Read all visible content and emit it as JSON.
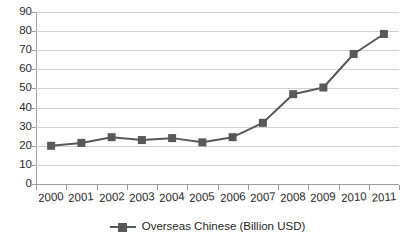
{
  "chart_data": {
    "type": "line",
    "title": "",
    "subtitle": "",
    "xlabel": "",
    "ylabel": "",
    "categories": [
      "2000",
      "2001",
      "2002",
      "2003",
      "2004",
      "2005",
      "2006",
      "2007",
      "2008",
      "2009",
      "2010",
      "2011"
    ],
    "series": [
      {
        "name": "Overseas Chinese (Billion USD)",
        "color": "#595959",
        "marker": "square",
        "values": [
          20,
          21.5,
          24.5,
          23,
          24,
          21.8,
          24.5,
          32,
          47,
          50.5,
          68,
          78.5
        ]
      }
    ],
    "ylim": [
      0,
      90
    ],
    "yticks": [
      0,
      10,
      20,
      30,
      40,
      50,
      60,
      70,
      80,
      90
    ],
    "ytick_labels": [
      "0",
      "10",
      "20",
      "30",
      "40",
      "50",
      "60",
      "70",
      "80",
      "90"
    ],
    "grid": true,
    "grid_axis": "y",
    "legend": {
      "position": "bottom-center",
      "entries": [
        "Overseas Chinese (Billion USD)"
      ]
    }
  },
  "legend": {
    "label": "Overseas Chinese (Billion USD)"
  },
  "colors": {
    "series": "#595959",
    "gridline": "#d2d2d2",
    "axis": "#9a9a9a",
    "text": "#2b2b2b",
    "background": "#ffffff"
  }
}
